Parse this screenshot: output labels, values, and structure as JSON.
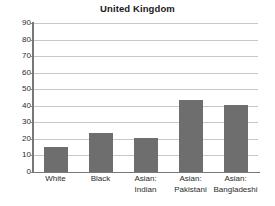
{
  "chart_data": {
    "type": "bar",
    "title": "United Kingdom",
    "subtitle": "",
    "xlabel": "",
    "ylabel": "",
    "categories": [
      "White",
      "Asian:\nIndian",
      "Black",
      "Asian:\nPakistani",
      "Asian:\nBangladeshi"
    ],
    "category_lines": [
      [
        "White"
      ],
      [
        "Black"
      ],
      [
        "Asian:",
        "Indian"
      ],
      [
        "Asian:",
        "Pakistani"
      ],
      [
        "Asian:",
        "Bangladeshi"
      ]
    ],
    "categories_ordered": [
      "White",
      "Black",
      "Asian: Indian",
      "Asian: Pakistani",
      "Asian: Bangladeshi"
    ],
    "values": [
      15,
      23.5,
      20.5,
      43.5,
      40.5
    ],
    "ylim": [
      0,
      90
    ],
    "ytick_labels": [
      "90",
      "80",
      "70",
      "60",
      "50",
      "40",
      "30",
      "20",
      "10",
      "0"
    ],
    "ytick_values": [
      90,
      80,
      70,
      60,
      50,
      40,
      30,
      20,
      10,
      0
    ],
    "ytick_step": 10,
    "grid": "horizontal",
    "legend": "none",
    "bar_color": "#6e6e6e",
    "gridline_color": "#c8c8c8",
    "axis_color": "#777777",
    "background_color": "#ffffff",
    "text_color": "#2b2b2b"
  }
}
